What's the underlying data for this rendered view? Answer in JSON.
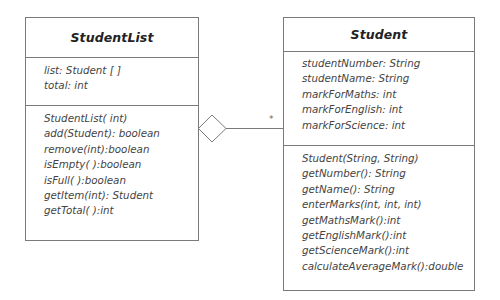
{
  "diagram": {
    "type": "uml-class-diagram",
    "classes": [
      {
        "name": "StudentList",
        "attributes": [
          "list: Student [ ]",
          "total: int"
        ],
        "operations": [
          "StudentList( int)",
          "add(Student): boolean",
          "remove(int):boolean",
          "isEmpty( ):boolean",
          "isFull( ):boolean",
          "getItem(int): Student",
          "getTotal( ):int"
        ]
      },
      {
        "name": "Student",
        "attributes": [
          "studentNumber: String",
          "studentName: String",
          "markForMaths: int",
          "markForEnglish: int",
          "markForScience: int"
        ],
        "operations": [
          "Student(String, String)",
          "getNumber(): String",
          "getName(): String",
          "enterMarks(int, int, int)",
          "getMathsMark():int",
          "getEnglishMark():int",
          "getScienceMark():int",
          "calculateAverageMark():double"
        ]
      }
    ],
    "relationship": {
      "type": "aggregation",
      "from": "StudentList",
      "to": "Student",
      "multiplicity": "*",
      "icon": "hollow-diamond"
    },
    "colors": {
      "border": "#7a7a7a",
      "text": "#444444",
      "title": "#222222",
      "background": "#ffffff"
    }
  }
}
